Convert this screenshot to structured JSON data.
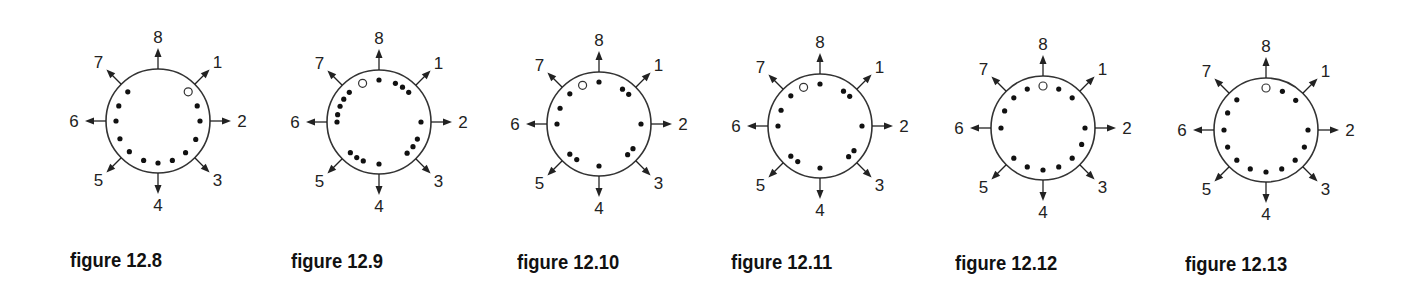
{
  "directions": [
    {
      "label": "1",
      "angle": 45
    },
    {
      "label": "2",
      "angle": 90
    },
    {
      "label": "3",
      "angle": 135
    },
    {
      "label": "4",
      "angle": 180
    },
    {
      "label": "5",
      "angle": 225
    },
    {
      "label": "6",
      "angle": 270
    },
    {
      "label": "7",
      "angle": 315
    },
    {
      "label": "8",
      "angle": 0
    }
  ],
  "style": {
    "ink": "#222222",
    "circle_stroke": "#333333",
    "radius": 52,
    "dot_radius_inner": 42
  },
  "figures": [
    {
      "caption": "figure 12.8",
      "center": [
        158,
        121
      ],
      "caption_pos": [
        70,
        249
      ],
      "open": [
        46
      ],
      "dots": [
        69,
        90,
        116,
        139,
        160,
        180,
        200,
        223,
        245,
        270,
        291,
        314
      ]
    },
    {
      "caption": "figure 12.9",
      "center": [
        379,
        122
      ],
      "caption_pos": [
        291,
        250
      ],
      "open": [
        337
      ],
      "dots": [
        0,
        23,
        34,
        45,
        90,
        114,
        126,
        138,
        180,
        202,
        212,
        223,
        270,
        280,
        292,
        303,
        315
      ]
    },
    {
      "caption": "figure 12.10",
      "center": [
        599,
        124
      ],
      "caption_pos": [
        517,
        251
      ],
      "open": [
        337
      ],
      "dots": [
        0,
        34,
        45,
        90,
        126,
        137,
        180,
        212,
        224,
        270,
        292,
        316
      ]
    },
    {
      "caption": "figure 12.11",
      "center": [
        820,
        126
      ],
      "caption_pos": [
        731,
        251
      ],
      "open": [
        337
      ],
      "dots": [
        0,
        34,
        45,
        90,
        126,
        137,
        180,
        212,
        224,
        270,
        292,
        316
      ]
    },
    {
      "caption": "figure 12.12",
      "center": [
        1043,
        128
      ],
      "caption_pos": [
        955,
        252
      ],
      "open": [
        0
      ],
      "dots": [
        22,
        44,
        90,
        113,
        136,
        158,
        180,
        202,
        224,
        270,
        294,
        316,
        338
      ]
    },
    {
      "caption": "figure 12.13",
      "center": [
        1266,
        130
      ],
      "caption_pos": [
        1185,
        253
      ],
      "open": [
        0
      ],
      "dots": [
        23,
        45,
        90,
        114,
        136,
        158,
        180,
        202,
        224,
        246,
        270,
        294,
        316
      ]
    }
  ]
}
